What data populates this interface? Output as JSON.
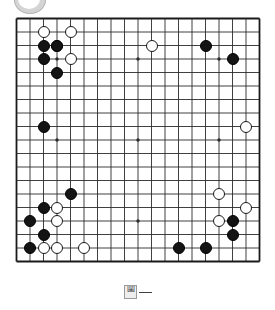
{
  "app": {
    "title": "Go Board Position",
    "top_chrome_icon": "circle-badge"
  },
  "board": {
    "size": 19,
    "line_color": "#2b2b2b",
    "border_color": "#1a1a1a",
    "background_color": "#ffffff",
    "star_points": [
      [
        3,
        3
      ],
      [
        9,
        3
      ],
      [
        15,
        3
      ],
      [
        3,
        9
      ],
      [
        9,
        9
      ],
      [
        15,
        9
      ],
      [
        3,
        15
      ],
      [
        9,
        15
      ],
      [
        15,
        15
      ]
    ],
    "black_stone_color": "#141414",
    "white_stone_color": "#ffffff",
    "black_stones": [
      [
        2,
        2
      ],
      [
        2,
        3
      ],
      [
        3,
        2
      ],
      [
        3,
        4
      ],
      [
        14,
        2
      ],
      [
        16,
        3
      ],
      [
        2,
        8
      ],
      [
        4,
        13
      ],
      [
        2,
        14
      ],
      [
        1,
        15
      ],
      [
        2,
        16
      ],
      [
        1,
        17
      ],
      [
        16,
        15
      ],
      [
        16,
        16
      ],
      [
        12,
        17
      ],
      [
        14,
        17
      ]
    ],
    "white_stones": [
      [
        2,
        1
      ],
      [
        4,
        1
      ],
      [
        3,
        2
      ],
      [
        4,
        3
      ],
      [
        10,
        2
      ],
      [
        17,
        8
      ],
      [
        15,
        13
      ],
      [
        17,
        14
      ],
      [
        15,
        15
      ],
      [
        3,
        14
      ],
      [
        3,
        15
      ],
      [
        2,
        17
      ],
      [
        3,
        17
      ],
      [
        5,
        17
      ]
    ]
  },
  "footer": {
    "glyph": "圍",
    "mark": "rule-line"
  }
}
